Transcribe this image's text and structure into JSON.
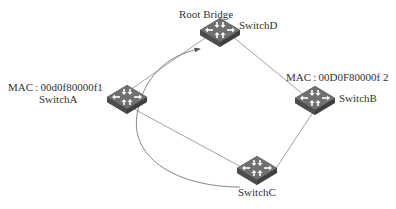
{
  "diagram": {
    "type": "network-topology",
    "root_label": "Root Bridge",
    "nodes": [
      {
        "id": "SwitchA",
        "name": "SwitchA",
        "mac": "MAC : 00d0f80000f1"
      },
      {
        "id": "SwitchB",
        "name": "SwitchB",
        "mac": "MAC : 00D0F80000f 2"
      },
      {
        "id": "SwitchC",
        "name": "SwitchC"
      },
      {
        "id": "SwitchD",
        "name": "SwitchD",
        "role": "Root Bridge"
      }
    ],
    "links": [
      {
        "from": "SwitchA",
        "to": "SwitchD"
      },
      {
        "from": "SwitchD",
        "to": "SwitchB"
      },
      {
        "from": "SwitchB",
        "to": "SwitchC"
      },
      {
        "from": "SwitchA",
        "to": "SwitchC"
      }
    ],
    "arrows": [
      {
        "from": "SwitchC",
        "to": "SwitchD",
        "style": "curved",
        "via": "SwitchA"
      }
    ],
    "colors": {
      "line": "#8a8a8a",
      "switch_top": "#6f6f6f",
      "switch_side": "#3f3f3f",
      "glyph": "#ffffff"
    }
  }
}
